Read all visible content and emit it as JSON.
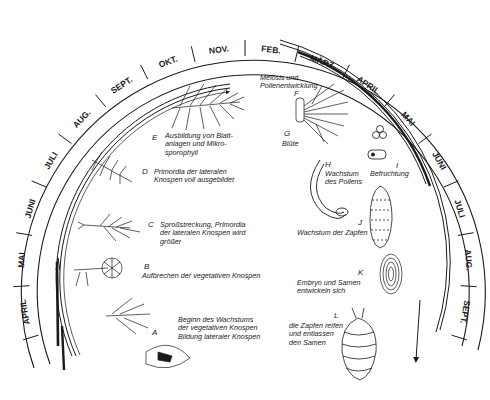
{
  "diagram": {
    "type": "annual reproductive cycle (conifer / pine)",
    "ring": {
      "center": [
        245,
        272
      ],
      "months_outer_ring": [
        {
          "label": "APRIL",
          "side": "left"
        },
        {
          "label": "MAI",
          "side": "left"
        },
        {
          "label": "JUNI",
          "side": "left"
        },
        {
          "label": "JULI",
          "side": "left"
        },
        {
          "label": "AUG.",
          "side": "left"
        },
        {
          "label": "SEPT.",
          "side": "left"
        },
        {
          "label": "OKT.",
          "side": "top"
        },
        {
          "label": "NOV.",
          "side": "top"
        },
        {
          "label": "FEB.",
          "side": "top"
        },
        {
          "label": "MÄRZ",
          "side": "top"
        },
        {
          "label": "APRIL",
          "side": "right"
        },
        {
          "label": "MAI",
          "side": "right"
        },
        {
          "label": "JUNI",
          "side": "right"
        },
        {
          "label": "JULI",
          "side": "right"
        },
        {
          "label": "AUG.",
          "side": "right"
        },
        {
          "label": "SEPT.",
          "side": "right"
        }
      ]
    },
    "stages": [
      {
        "letter": "A",
        "caption": "Beginn des Wachstums\nder vegetativen Knospen\nBildung lateraler Knospen"
      },
      {
        "letter": "B",
        "caption": "Aufbrechen der vegetativen Knospen"
      },
      {
        "letter": "C",
        "caption": "Sproßstreckung, Primordia\nder lateralen Knospen wird\ngrößer"
      },
      {
        "letter": "D",
        "caption": "Primordia der lateralen\nKnospen voll ausgebildet"
      },
      {
        "letter": "E",
        "caption": "Ausbildung von Blatt-\nanlagen und Mikro-\nsporophyll"
      },
      {
        "letter": "F",
        "caption": "Meiosis und\nPollenentwicklung"
      },
      {
        "letter": "G",
        "caption": "Blüte"
      },
      {
        "letter": "H",
        "caption": "Wachstum\ndes Pollens"
      },
      {
        "letter": "I",
        "caption": "Befruchtung"
      },
      {
        "letter": "J",
        "caption": "Wachstum der Zapfen"
      },
      {
        "letter": "K",
        "caption": "Embryo und Samen\nentwickeln sich"
      },
      {
        "letter": "L",
        "caption": "die Zapfen reifen\nund entlassen\nden Samen"
      }
    ],
    "colors": {
      "ink": "#1a1a1a",
      "paper": "#ffffff"
    }
  }
}
